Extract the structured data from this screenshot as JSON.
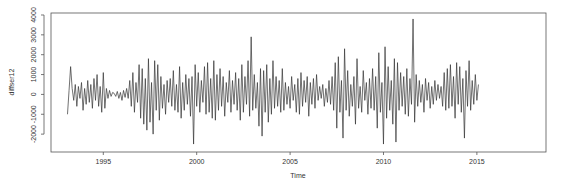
{
  "chart_data": {
    "type": "line",
    "title": "",
    "xlabel": "Time",
    "ylabel": "diffser12",
    "xlim": [
      1992.2,
      2018.7
    ],
    "ylim": [
      -2900,
      4100
    ],
    "x_ticks": [
      1995,
      2000,
      2005,
      2010,
      2015
    ],
    "x_tick_labels": [
      "1995",
      "2000",
      "2005",
      "2010",
      "2015"
    ],
    "y_ticks": [
      -2000,
      -1000,
      0,
      1000,
      2000,
      3000,
      4000
    ],
    "y_tick_labels": [
      "-2000",
      "-1000",
      "0",
      "1000",
      "2000",
      "3000",
      "4000"
    ],
    "grid": false,
    "legend": null,
    "line_color": "#333333",
    "series": [
      {
        "name": "diffser12",
        "start": 1993.083,
        "frequency": 12,
        "values": [
          -1000,
          200,
          1400,
          300,
          -300,
          500,
          -600,
          400,
          -200,
          600,
          -800,
          300,
          -500,
          700,
          -400,
          500,
          -700,
          800,
          -300,
          1000,
          -600,
          400,
          -900,
          1100,
          -700,
          300,
          -200,
          200,
          -100,
          100,
          50,
          -100,
          150,
          -200,
          100,
          -300,
          200,
          -150,
          300,
          -200,
          700,
          -600,
          1100,
          -900,
          600,
          -400,
          1500,
          -1200,
          1300,
          -1500,
          800,
          -1800,
          1800,
          -1400,
          600,
          -2000,
          1700,
          -800,
          1500,
          -1300,
          900,
          -700,
          500,
          -1000,
          700,
          -400,
          800,
          -600,
          1200,
          -800,
          500,
          -900,
          1400,
          -1200,
          600,
          -800,
          1000,
          -500,
          800,
          -1100,
          900,
          -2500,
          1500,
          -600,
          1100,
          -900,
          700,
          -400,
          1400,
          -1000,
          1600,
          -900,
          800,
          -1200,
          1700,
          -1300,
          1000,
          -800,
          1300,
          -600,
          900,
          -1100,
          600,
          -400,
          1200,
          -900,
          700,
          -500,
          1100,
          -800,
          800,
          -1300,
          1500,
          -900,
          900,
          -500,
          1700,
          -1100,
          2900,
          -800,
          1000,
          -700,
          600,
          -1600,
          1300,
          -2100,
          1200,
          -900,
          1500,
          -1400,
          800,
          -1000,
          1700,
          -700,
          900,
          -600,
          700,
          -900,
          1300,
          -800,
          600,
          -500,
          400,
          -700,
          900,
          -300,
          500,
          -900,
          800,
          -1000,
          1100,
          -600,
          700,
          -400,
          900,
          -1100,
          600,
          -500,
          800,
          -700,
          1000,
          -300,
          400,
          -200,
          500,
          -600,
          300,
          -400,
          700,
          -500,
          900,
          -800,
          1600,
          -1700,
          1900,
          -900,
          700,
          -2200,
          2300,
          -800,
          1200,
          -1100,
          500,
          -600,
          900,
          -1500,
          1800,
          -700,
          400,
          -900,
          1200,
          -300,
          600,
          -1000,
          800,
          -700,
          1300,
          -800,
          900,
          -1700,
          2100,
          -900,
          600,
          -2500,
          2400,
          -1200,
          1400,
          -800,
          700,
          -1500,
          1800,
          -2400,
          1600,
          -800,
          1100,
          -600,
          900,
          -1000,
          1300,
          -1100,
          800,
          -500,
          3800,
          -1400,
          1000,
          -600,
          700,
          -400,
          500,
          -900,
          800,
          -300,
          600,
          -700,
          400,
          -500,
          700,
          -300,
          500,
          -200,
          400,
          -600,
          1100,
          -800,
          1300,
          -700,
          1500,
          -600,
          900,
          -1200,
          1600,
          -500,
          1400,
          -900,
          800,
          -2200,
          1200,
          -600,
          1700,
          -800,
          700,
          -500,
          1000,
          -300,
          500
        ]
      }
    ]
  }
}
